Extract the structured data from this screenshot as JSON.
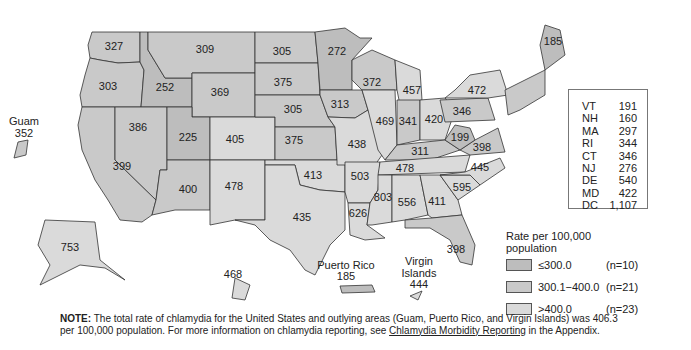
{
  "colors": {
    "low": "#bdbdbd",
    "mid": "#c9c9c9",
    "high": "#dadada",
    "border": "#333333"
  },
  "states": [
    {
      "abbr": "WA",
      "value": "327",
      "class": "mid"
    },
    {
      "abbr": "OR",
      "value": "303",
      "class": "mid"
    },
    {
      "abbr": "CA",
      "value": "399",
      "class": "mid"
    },
    {
      "abbr": "ID",
      "value": "252",
      "class": "low"
    },
    {
      "abbr": "NV",
      "value": "386",
      "class": "mid"
    },
    {
      "abbr": "MT",
      "value": "309",
      "class": "mid"
    },
    {
      "abbr": "WY",
      "value": "369",
      "class": "mid"
    },
    {
      "abbr": "UT",
      "value": "225",
      "class": "low"
    },
    {
      "abbr": "AZ",
      "value": "400",
      "class": "mid"
    },
    {
      "abbr": "CO",
      "value": "405",
      "class": "high"
    },
    {
      "abbr": "NM",
      "value": "478",
      "class": "high"
    },
    {
      "abbr": "ND",
      "value": "305",
      "class": "mid"
    },
    {
      "abbr": "SD",
      "value": "375",
      "class": "mid"
    },
    {
      "abbr": "NE",
      "value": "305",
      "class": "mid"
    },
    {
      "abbr": "KS",
      "value": "375",
      "class": "mid"
    },
    {
      "abbr": "OK",
      "value": "413",
      "class": "high"
    },
    {
      "abbr": "TX",
      "value": "435",
      "class": "high"
    },
    {
      "abbr": "MN",
      "value": "272",
      "class": "low"
    },
    {
      "abbr": "IA",
      "value": "313",
      "class": "mid"
    },
    {
      "abbr": "MO",
      "value": "438",
      "class": "high"
    },
    {
      "abbr": "AR",
      "value": "503",
      "class": "high"
    },
    {
      "abbr": "LA",
      "value": "626",
      "class": "high"
    },
    {
      "abbr": "WI",
      "value": "372",
      "class": "mid"
    },
    {
      "abbr": "IL",
      "value": "469",
      "class": "high"
    },
    {
      "abbr": "MI",
      "value": "457",
      "class": "high"
    },
    {
      "abbr": "IN",
      "value": "341",
      "class": "mid"
    },
    {
      "abbr": "OH",
      "value": "420",
      "class": "high"
    },
    {
      "abbr": "KY",
      "value": "311",
      "class": "mid"
    },
    {
      "abbr": "TN",
      "value": "478",
      "class": "high"
    },
    {
      "abbr": "MS",
      "value": "803",
      "class": "high"
    },
    {
      "abbr": "AL",
      "value": "556",
      "class": "high"
    },
    {
      "abbr": "GA",
      "value": "411",
      "class": "high"
    },
    {
      "abbr": "FL",
      "value": "398",
      "class": "mid"
    },
    {
      "abbr": "SC",
      "value": "595",
      "class": "high"
    },
    {
      "abbr": "NC",
      "value": "445",
      "class": "high"
    },
    {
      "abbr": "VA",
      "value": "398",
      "class": "mid"
    },
    {
      "abbr": "WV",
      "value": "199",
      "class": "low"
    },
    {
      "abbr": "PA",
      "value": "346",
      "class": "mid"
    },
    {
      "abbr": "NY",
      "value": "472",
      "class": "high"
    },
    {
      "abbr": "ME",
      "value": "185",
      "class": "low"
    },
    {
      "abbr": "AK",
      "value": "753",
      "class": "high"
    },
    {
      "abbr": "HI",
      "value": "468",
      "class": "high"
    }
  ],
  "territories": {
    "guam": {
      "name": "Guam",
      "value": "352"
    },
    "puerto_rico": {
      "name": "Puerto Rico",
      "value": "185"
    },
    "virgin_islands": {
      "name_line1": "Virgin",
      "name_line2": "Islands",
      "value": "444"
    }
  },
  "inset_table": [
    {
      "abbr": "VT",
      "value": "191"
    },
    {
      "abbr": "NH",
      "value": "160"
    },
    {
      "abbr": "MA",
      "value": "297"
    },
    {
      "abbr": "RI",
      "value": "344"
    },
    {
      "abbr": "CT",
      "value": "346"
    },
    {
      "abbr": "NJ",
      "value": "276"
    },
    {
      "abbr": "DE",
      "value": "540"
    },
    {
      "abbr": "MD",
      "value": "422"
    },
    {
      "abbr": "DC",
      "value": "1,107"
    }
  ],
  "legend": {
    "title": "Rate per 100,000 population",
    "items": [
      {
        "range": "≤300.0",
        "count": "(n=10)",
        "class": "low"
      },
      {
        "range": "300.1−400.0",
        "count": "(n=21)",
        "class": "mid"
      },
      {
        "range": ">400.0",
        "count": "(n=23)",
        "class": "high"
      }
    ]
  },
  "note": {
    "label": "NOTE:",
    "text1": " The total rate of chlamydia for the United States and outlying areas (Guam, Puerto Rico, and Virgin Islands) was 406.3 per 100,000 population. For more information on chlamydia reporting, see ",
    "link": "Chlamydia Morbidity Reporting",
    "text2": " in the Appendix."
  }
}
